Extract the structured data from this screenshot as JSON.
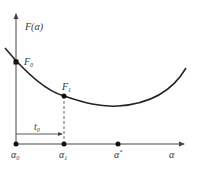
{
  "diagram": {
    "type": "line-search-plot",
    "y_axis_label": "F(α)",
    "x_axis_label": "α",
    "points": [
      {
        "id": "F0",
        "label": "F",
        "sub": "0",
        "x": 16,
        "y": 62
      },
      {
        "id": "F1",
        "label": "F",
        "sub": "1",
        "x": 64,
        "y": 96
      }
    ],
    "x_axis_points": [
      {
        "id": "alpha0",
        "label": "α",
        "sub": "0",
        "x": 16
      },
      {
        "id": "alpha1",
        "label": "α",
        "sub": "1",
        "x": 64
      },
      {
        "id": "alpha_star",
        "label": "α",
        "sup": "*",
        "x": 118
      }
    ],
    "step_label": {
      "label": "t",
      "sub": "0"
    },
    "colors": {
      "curve": "#222222",
      "axis": "#444444",
      "point": "#111111",
      "dashed": "#555555"
    }
  }
}
